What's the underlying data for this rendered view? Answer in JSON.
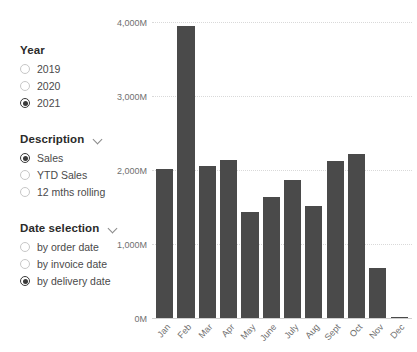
{
  "filters": {
    "groups": [
      {
        "name": "year",
        "title": "Year",
        "has_chevron": false,
        "options": [
          {
            "label": "2019",
            "selected": false
          },
          {
            "label": "2020",
            "selected": false
          },
          {
            "label": "2021",
            "selected": true
          }
        ]
      },
      {
        "name": "description",
        "title": "Description",
        "has_chevron": true,
        "options": [
          {
            "label": "Sales",
            "selected": true
          },
          {
            "label": "YTD Sales",
            "selected": false
          },
          {
            "label": "12 mths rolling",
            "selected": false
          }
        ]
      },
      {
        "name": "date-selection",
        "title": "Date selection",
        "has_chevron": true,
        "options": [
          {
            "label": "by order date",
            "selected": false
          },
          {
            "label": "by invoice date",
            "selected": false
          },
          {
            "label": "by delivery date",
            "selected": true
          }
        ]
      }
    ]
  },
  "chart_data": {
    "type": "bar",
    "title": "",
    "xlabel": "",
    "ylabel": "",
    "categories": [
      "Jan",
      "Feb",
      "Mar",
      "Apr",
      "May",
      "June",
      "July",
      "Aug",
      "Sept",
      "Oct",
      "Nov",
      "Dec"
    ],
    "values": [
      2010,
      3950,
      2050,
      2130,
      1430,
      1630,
      1860,
      1520,
      2120,
      2210,
      680,
      15
    ],
    "series": [
      {
        "name": "Sales",
        "values": [
          2010,
          3950,
          2050,
          2130,
          1430,
          1630,
          1860,
          1520,
          2120,
          2210,
          680,
          15
        ]
      }
    ],
    "ylim": [
      0,
      4000
    ],
    "yticks": [
      0,
      1000,
      2000,
      3000,
      4000
    ],
    "ytick_labels": [
      "0M",
      "1,000M",
      "2,000M",
      "3,000M",
      "4,000M"
    ],
    "grid": true,
    "legend": "none",
    "bar_color": "#4a4a4a",
    "grid_color": "#d9d9d9",
    "axis_color": "#cfcfcf"
  }
}
